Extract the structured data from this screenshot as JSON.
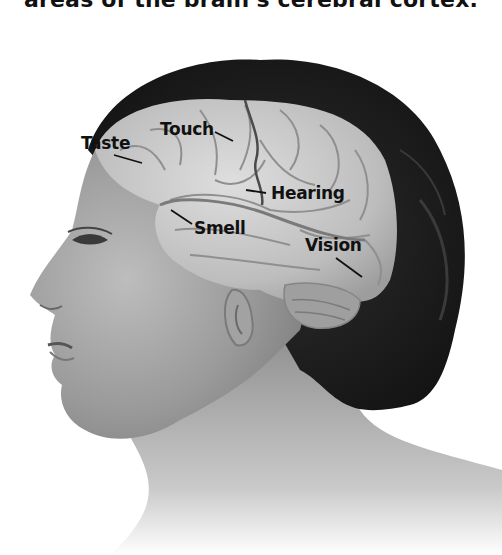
{
  "caption": "areas of the brain's cerebral cortex.",
  "labels": {
    "taste": "Taste",
    "touch": "Touch",
    "hearing": "Hearing",
    "smell": "Smell",
    "vision": "Vision"
  },
  "colors": {
    "background": "#ffffff",
    "hair": "#1e1e1e",
    "skin": "#a8a8a8",
    "brain": "#c8c8c8",
    "label_text": "#111111"
  }
}
